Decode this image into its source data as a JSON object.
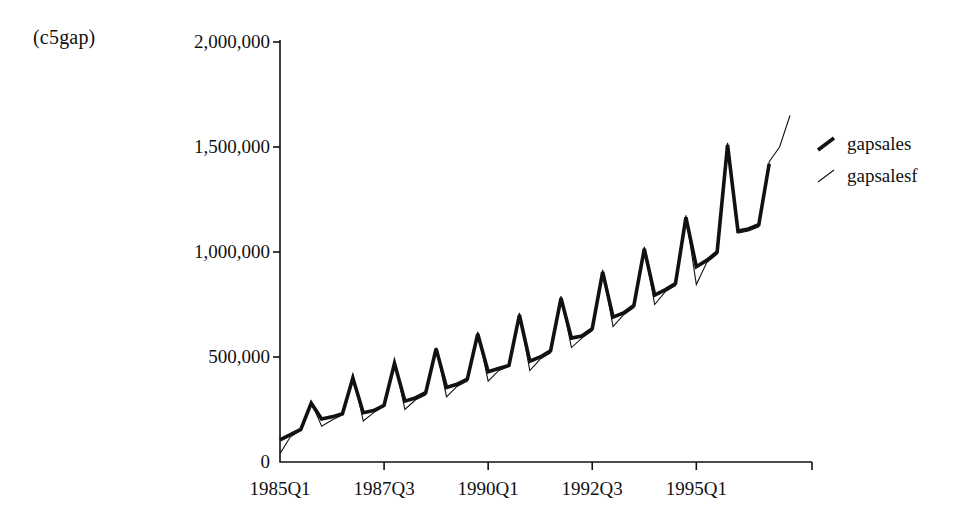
{
  "figure": {
    "corner_label": "(c5gap)",
    "background_color": "#ffffff",
    "ink_color": "#111111"
  },
  "legend": {
    "position": "right",
    "entries": [
      {
        "label": "gapsales",
        "marker": "thick-diagonal-line-icon",
        "line_width": 3.6,
        "color": "#111111"
      },
      {
        "label": "gapsalesf",
        "marker": "thin-diagonal-line-icon",
        "line_width": 1.1,
        "color": "#111111"
      }
    ]
  },
  "axes": {
    "y_ticks": [
      "0",
      "500,000",
      "1,000,000",
      "1,500,000",
      "2,000,000"
    ],
    "y_tick_values": [
      0,
      500000,
      1000000,
      1500000,
      2000000
    ],
    "x_ticks": [
      "1985Q1",
      "1987Q3",
      "1990Q1",
      "1992Q3",
      "1995Q1"
    ],
    "x_tick_indices": [
      0,
      10,
      20,
      30,
      40
    ]
  },
  "chart_data": {
    "type": "line",
    "title": "(c5gap)",
    "xlabel": "",
    "ylabel": "",
    "ylim": [
      0,
      2000000
    ],
    "grid": false,
    "legend_position": "right",
    "x": [
      "1985Q1",
      "1985Q2",
      "1985Q3",
      "1985Q4",
      "1986Q1",
      "1986Q2",
      "1986Q3",
      "1986Q4",
      "1987Q1",
      "1987Q2",
      "1987Q3",
      "1987Q4",
      "1988Q1",
      "1988Q2",
      "1988Q3",
      "1988Q4",
      "1989Q1",
      "1989Q2",
      "1989Q3",
      "1989Q4",
      "1990Q1",
      "1990Q2",
      "1990Q3",
      "1990Q4",
      "1991Q1",
      "1991Q2",
      "1991Q3",
      "1991Q4",
      "1992Q1",
      "1992Q2",
      "1992Q3",
      "1992Q4",
      "1993Q1",
      "1993Q2",
      "1993Q3",
      "1993Q4",
      "1994Q1",
      "1994Q2",
      "1994Q3",
      "1994Q4",
      "1995Q1",
      "1995Q2",
      "1995Q3",
      "1995Q4",
      "1996Q1",
      "1996Q2",
      "1996Q3",
      "1996Q4",
      "1997Q1",
      "1997Q2"
    ],
    "series": [
      {
        "name": "gapsales",
        "line_width": 3.6,
        "color": "#111111",
        "values": [
          105000,
          130000,
          155000,
          280000,
          205000,
          215000,
          230000,
          400000,
          235000,
          245000,
          270000,
          470000,
          290000,
          305000,
          330000,
          540000,
          355000,
          370000,
          395000,
          610000,
          430000,
          445000,
          460000,
          700000,
          480000,
          500000,
          530000,
          780000,
          590000,
          600000,
          635000,
          905000,
          690000,
          710000,
          745000,
          1015000,
          795000,
          820000,
          850000,
          1165000,
          930000,
          960000,
          1000000,
          1510000,
          1100000,
          1110000,
          1130000,
          1420000,
          null,
          null
        ]
      },
      {
        "name": "gapsalesf",
        "line_width": 1.1,
        "color": "#111111",
        "values": [
          40000,
          120000,
          150000,
          285000,
          170000,
          200000,
          225000,
          420000,
          195000,
          235000,
          265000,
          480000,
          250000,
          295000,
          320000,
          545000,
          310000,
          360000,
          385000,
          620000,
          385000,
          435000,
          455000,
          710000,
          435000,
          490000,
          520000,
          790000,
          545000,
          590000,
          625000,
          915000,
          645000,
          700000,
          735000,
          1025000,
          750000,
          810000,
          840000,
          1175000,
          845000,
          950000,
          990000,
          1520000,
          1090000,
          1100000,
          1120000,
          1430000,
          1500000,
          1650000
        ]
      }
    ]
  }
}
